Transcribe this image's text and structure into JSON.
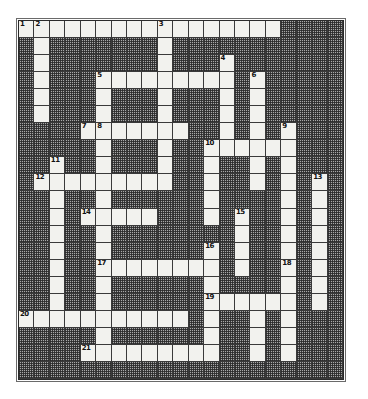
{
  "puzzle": {
    "kind": "crossword-grid",
    "title": "Crossword Puzzle Grid",
    "columns": 21,
    "rows": 21,
    "colors": {
      "light_cell": "#f2f2ee",
      "dark_cell": "#a8a8a8",
      "grid_line": "#3a3a3a",
      "frame": "#6a6a6a",
      "page_background": "#ffffff",
      "number_text": "#000000"
    },
    "light_cells": [
      [
        0,
        0
      ],
      [
        0,
        1
      ],
      [
        0,
        2
      ],
      [
        0,
        3
      ],
      [
        0,
        4
      ],
      [
        0,
        5
      ],
      [
        0,
        6
      ],
      [
        0,
        7
      ],
      [
        0,
        8
      ],
      [
        0,
        9
      ],
      [
        0,
        10
      ],
      [
        0,
        11
      ],
      [
        0,
        12
      ],
      [
        0,
        13
      ],
      [
        0,
        14
      ],
      [
        0,
        15
      ],
      [
        0,
        16
      ],
      [
        1,
        1
      ],
      [
        1,
        9
      ],
      [
        2,
        1
      ],
      [
        2,
        9
      ],
      [
        2,
        13
      ],
      [
        3,
        1
      ],
      [
        3,
        5
      ],
      [
        3,
        6
      ],
      [
        3,
        7
      ],
      [
        3,
        8
      ],
      [
        3,
        9
      ],
      [
        3,
        10
      ],
      [
        3,
        11
      ],
      [
        3,
        12
      ],
      [
        3,
        13
      ],
      [
        3,
        15
      ],
      [
        4,
        1
      ],
      [
        4,
        5
      ],
      [
        4,
        9
      ],
      [
        4,
        13
      ],
      [
        4,
        15
      ],
      [
        5,
        1
      ],
      [
        5,
        5
      ],
      [
        5,
        9
      ],
      [
        5,
        13
      ],
      [
        5,
        15
      ],
      [
        6,
        4
      ],
      [
        6,
        5
      ],
      [
        6,
        6
      ],
      [
        6,
        7
      ],
      [
        6,
        8
      ],
      [
        6,
        9
      ],
      [
        6,
        10
      ],
      [
        6,
        13
      ],
      [
        6,
        15
      ],
      [
        6,
        17
      ],
      [
        7,
        5
      ],
      [
        7,
        9
      ],
      [
        7,
        12
      ],
      [
        7,
        13
      ],
      [
        7,
        14
      ],
      [
        7,
        15
      ],
      [
        7,
        16
      ],
      [
        7,
        17
      ],
      [
        8,
        2
      ],
      [
        8,
        5
      ],
      [
        8,
        9
      ],
      [
        8,
        12
      ],
      [
        8,
        15
      ],
      [
        8,
        17
      ],
      [
        9,
        1
      ],
      [
        9,
        2
      ],
      [
        9,
        3
      ],
      [
        9,
        4
      ],
      [
        9,
        5
      ],
      [
        9,
        6
      ],
      [
        9,
        7
      ],
      [
        9,
        8
      ],
      [
        9,
        9
      ],
      [
        9,
        12
      ],
      [
        9,
        15
      ],
      [
        9,
        17
      ],
      [
        9,
        19
      ],
      [
        10,
        2
      ],
      [
        10,
        5
      ],
      [
        10,
        12
      ],
      [
        10,
        17
      ],
      [
        10,
        19
      ],
      [
        11,
        2
      ],
      [
        11,
        4
      ],
      [
        11,
        5
      ],
      [
        11,
        6
      ],
      [
        11,
        7
      ],
      [
        11,
        8
      ],
      [
        11,
        12
      ],
      [
        11,
        14
      ],
      [
        11,
        17
      ],
      [
        11,
        19
      ],
      [
        12,
        2
      ],
      [
        12,
        5
      ],
      [
        12,
        14
      ],
      [
        12,
        17
      ],
      [
        12,
        19
      ],
      [
        13,
        2
      ],
      [
        13,
        5
      ],
      [
        13,
        12
      ],
      [
        13,
        14
      ],
      [
        13,
        17
      ],
      [
        13,
        19
      ],
      [
        14,
        2
      ],
      [
        14,
        5
      ],
      [
        14,
        6
      ],
      [
        14,
        7
      ],
      [
        14,
        8
      ],
      [
        14,
        9
      ],
      [
        14,
        10
      ],
      [
        14,
        11
      ],
      [
        14,
        12
      ],
      [
        14,
        14
      ],
      [
        14,
        17
      ],
      [
        14,
        19
      ],
      [
        15,
        2
      ],
      [
        15,
        5
      ],
      [
        15,
        12
      ],
      [
        15,
        17
      ],
      [
        15,
        19
      ],
      [
        16,
        2
      ],
      [
        16,
        5
      ],
      [
        16,
        12
      ],
      [
        16,
        13
      ],
      [
        16,
        14
      ],
      [
        16,
        15
      ],
      [
        16,
        16
      ],
      [
        16,
        17
      ],
      [
        16,
        19
      ],
      [
        17,
        0
      ],
      [
        17,
        1
      ],
      [
        17,
        2
      ],
      [
        17,
        3
      ],
      [
        17,
        4
      ],
      [
        17,
        5
      ],
      [
        17,
        6
      ],
      [
        17,
        7
      ],
      [
        17,
        8
      ],
      [
        17,
        9
      ],
      [
        17,
        10
      ],
      [
        17,
        12
      ],
      [
        17,
        15
      ],
      [
        17,
        17
      ],
      [
        18,
        5
      ],
      [
        18,
        12
      ],
      [
        18,
        15
      ],
      [
        18,
        17
      ],
      [
        19,
        4
      ],
      [
        19,
        5
      ],
      [
        19,
        6
      ],
      [
        19,
        7
      ],
      [
        19,
        8
      ],
      [
        19,
        9
      ],
      [
        19,
        10
      ],
      [
        19,
        11
      ],
      [
        19,
        12
      ],
      [
        19,
        15
      ],
      [
        19,
        17
      ]
    ],
    "numbers": [
      {
        "n": "1",
        "row": 0,
        "col": 0
      },
      {
        "n": "2",
        "row": 0,
        "col": 1
      },
      {
        "n": "3",
        "row": 0,
        "col": 9
      },
      {
        "n": "4",
        "row": 2,
        "col": 13
      },
      {
        "n": "5",
        "row": 3,
        "col": 5
      },
      {
        "n": "6",
        "row": 3,
        "col": 15
      },
      {
        "n": "7",
        "row": 6,
        "col": 4
      },
      {
        "n": "8",
        "row": 6,
        "col": 5
      },
      {
        "n": "9",
        "row": 6,
        "col": 17
      },
      {
        "n": "10",
        "row": 7,
        "col": 12
      },
      {
        "n": "11",
        "row": 8,
        "col": 2
      },
      {
        "n": "12",
        "row": 9,
        "col": 1
      },
      {
        "n": "13",
        "row": 9,
        "col": 19
      },
      {
        "n": "14",
        "row": 11,
        "col": 4
      },
      {
        "n": "15",
        "row": 11,
        "col": 14
      },
      {
        "n": "16",
        "row": 13,
        "col": 12
      },
      {
        "n": "17",
        "row": 14,
        "col": 5
      },
      {
        "n": "18",
        "row": 14,
        "col": 17
      },
      {
        "n": "19",
        "row": 16,
        "col": 12
      },
      {
        "n": "20",
        "row": 17,
        "col": 0
      },
      {
        "n": "21",
        "row": 19,
        "col": 4
      }
    ]
  }
}
